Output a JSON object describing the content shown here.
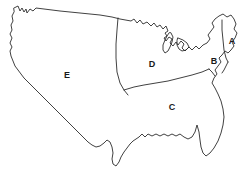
{
  "figure": {
    "name": "united-states-regions-map",
    "background_color": "#ffffff",
    "outline_color": "#2b2b2b",
    "label_color": "#1a1a1a",
    "width": 251,
    "height": 171
  },
  "regions": [
    {
      "id": "A",
      "label": "A",
      "name": "region-a-new-england",
      "x": 232,
      "y": 41
    },
    {
      "id": "B",
      "label": "B",
      "name": "region-b-mid-atlantic",
      "x": 214,
      "y": 61
    },
    {
      "id": "C",
      "label": "C",
      "name": "region-c-southeast",
      "x": 172,
      "y": 107
    },
    {
      "id": "D",
      "label": "D",
      "name": "region-d-midwest",
      "x": 152,
      "y": 64
    },
    {
      "id": "E",
      "label": "E",
      "name": "region-e-west",
      "x": 67,
      "y": 75
    }
  ]
}
